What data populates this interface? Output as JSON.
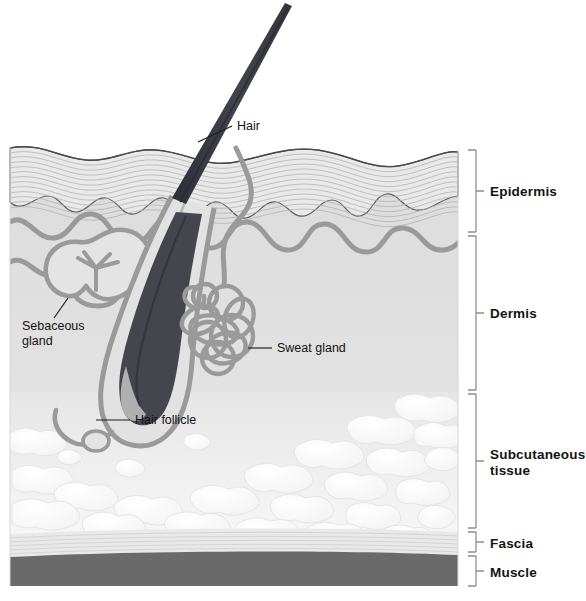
{
  "figure": {
    "background_color": "#ffffff"
  },
  "layer_brackets": [
    {
      "id": "epidermis",
      "label": "Epidermis",
      "top": 150,
      "bottom": 232,
      "label_y": 191
    },
    {
      "id": "dermis",
      "label": "Dermis",
      "top": 234,
      "bottom": 392,
      "label_y": 313
    },
    {
      "id": "subcutaneous",
      "label": "Subcutaneous",
      "label2": "tissue",
      "top": 394,
      "bottom": 529,
      "label_y": 455
    },
    {
      "id": "fascia",
      "label": "Fascia",
      "top": 531,
      "bottom": 553,
      "label_y": 547
    },
    {
      "id": "muscle",
      "label": "Muscle",
      "top": 555,
      "bottom": 586,
      "label_y": 576
    }
  ],
  "structure_labels": [
    {
      "id": "hair",
      "label": "Hair",
      "text_x": 237,
      "text_y": 130
    },
    {
      "id": "sebaceous-gland",
      "label": "Sebaceous",
      "label2": "gland",
      "text_x": 22,
      "text_y": 330
    },
    {
      "id": "sweat-gland",
      "label": "Sweat gland",
      "text_x": 277,
      "text_y": 352
    },
    {
      "id": "hair-follicle",
      "label": "Hair follicle",
      "text_x": 135,
      "text_y": 424
    }
  ],
  "colors": {
    "epidermis_fill": "#e8e8e8",
    "epidermis_stria": "#b5b5b5",
    "dermis_fill": "#dedede",
    "subcutaneous_fill": "#ececec",
    "fat_lobule_fill": "#fbfbfb",
    "fascia_fill": "#e4e4e4",
    "muscle_fill": "#6a6a6a",
    "hair_dark": "#3a3a42",
    "vessel_gray": "#9a9a9a",
    "outline": "#5e5e5e",
    "bracket": "#8f8f8f",
    "text": "#131313"
  }
}
